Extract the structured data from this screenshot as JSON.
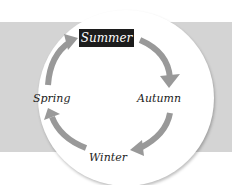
{
  "diagram": {
    "type": "cycle",
    "title": "",
    "colors": {
      "band": "#d4d4d4",
      "circle": "#ffffff",
      "arrow": "#999999",
      "highlight_bg": "#1c1c1c",
      "highlight_text": "#ffffff"
    },
    "nodes": [
      {
        "id": "summer",
        "label": "Summer",
        "highlighted": true
      },
      {
        "id": "autumn",
        "label": "Autumn",
        "highlighted": false
      },
      {
        "id": "winter",
        "label": "Winter",
        "highlighted": false
      },
      {
        "id": "spring",
        "label": "Spring",
        "highlighted": false
      }
    ],
    "edges": [
      {
        "from": "summer",
        "to": "autumn",
        "icon": "curved-arrow-icon"
      },
      {
        "from": "autumn",
        "to": "winter",
        "icon": "curved-arrow-icon"
      },
      {
        "from": "winter",
        "to": "spring",
        "icon": "curved-arrow-icon"
      },
      {
        "from": "spring",
        "to": "summer",
        "icon": "curved-arrow-icon"
      }
    ],
    "direction": "clockwise"
  }
}
